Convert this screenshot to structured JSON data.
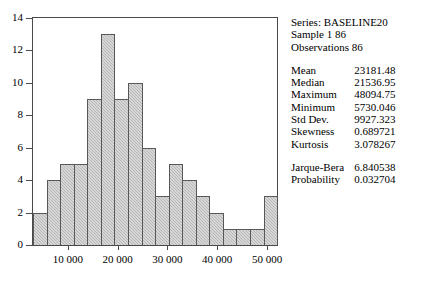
{
  "chart_data": {
    "type": "bar",
    "title": "",
    "xlabel": "",
    "ylabel": "",
    "ylim": [
      0,
      14
    ],
    "grid": false,
    "y_ticks": [
      0,
      2,
      4,
      6,
      8,
      10,
      12,
      14
    ],
    "x_ticks": [
      10000,
      20000,
      30000,
      40000,
      50000
    ],
    "x_tick_labels": [
      "10 000",
      "20 000",
      "30 000",
      "40 000",
      "50 000"
    ],
    "xlim": [
      3000,
      52000
    ],
    "categories": [
      "bin1",
      "bin2",
      "bin3",
      "bin4",
      "bin5",
      "bin6",
      "bin7",
      "bin8",
      "bin9",
      "bin10",
      "bin11",
      "bin12",
      "bin13",
      "bin14",
      "bin15",
      "bin16",
      "bin17",
      "bin18"
    ],
    "values": [
      2,
      4,
      5,
      5,
      9,
      13,
      9,
      10,
      6,
      3,
      5,
      4,
      3,
      2,
      1,
      1,
      1,
      3
    ],
    "bar_fill": "#b6b6b6",
    "bar_outline": "#585858",
    "axis_color": "#4a4a4a"
  },
  "stats": {
    "header": {
      "series": "Series: BASELINE20",
      "sample": "Sample 1 86",
      "observations": "Observations 86"
    },
    "rows": [
      {
        "key": "Mean",
        "value": "23181.48"
      },
      {
        "key": "Median",
        "value": "21536.95"
      },
      {
        "key": "Maximum",
        "value": "48094.75"
      },
      {
        "key": "Minimum",
        "value": "5730.046"
      },
      {
        "key": "Std Dev.",
        "value": "9927.323"
      },
      {
        "key": "Skewness",
        "value": "0.689721"
      },
      {
        "key": "Kurtosis",
        "value": "3.078267"
      }
    ],
    "test_rows": [
      {
        "key": "Jarque-Bera",
        "value": "6.840538"
      },
      {
        "key": "Probability",
        "value": "0.032704"
      }
    ]
  }
}
